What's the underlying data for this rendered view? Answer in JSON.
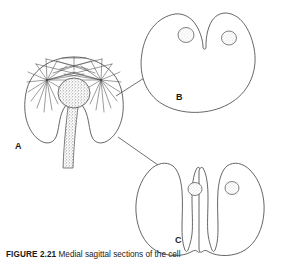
{
  "figure": {
    "caption_number": "FIGURE 2.21",
    "caption_text": "Medial sagittal sections of the cell",
    "background_color": "#ffffff",
    "line_color": "#4a4a4a",
    "label_color": "#1a1a1a",
    "stipple_color": "#8a8a8a"
  },
  "panels": [
    {
      "id": "A",
      "label": "A",
      "name": "cell-with-asters-and-sperm",
      "description": "Cell in cleavage with two asters, spindle fibers and stippled sperm head with tail"
    },
    {
      "id": "B",
      "label": "B",
      "name": "cell-early-cleavage-furrow",
      "description": "Rounded cell with shallow apical cleavage furrow and two stippled nuclei"
    },
    {
      "id": "C",
      "label": "C",
      "name": "cell-advanced-cleavage",
      "description": "Cell nearly divided with deep apical and basal furrows and two stippled nuclei"
    }
  ],
  "arrows": [
    {
      "name": "arrow-a-to-b",
      "from_panel": "A",
      "to_panel": "B"
    },
    {
      "name": "arrow-a-to-c",
      "from_panel": "A",
      "to_panel": "C"
    }
  ]
}
